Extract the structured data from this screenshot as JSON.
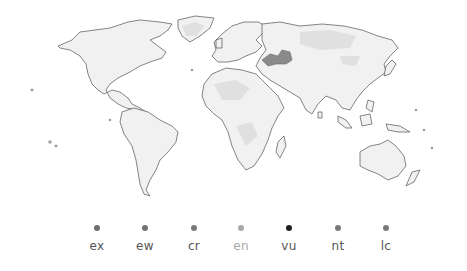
{
  "map": {
    "type": "world-distribution-map",
    "highlight_region": "central-asia"
  },
  "legend": {
    "items": [
      {
        "code": "ex",
        "x": 97,
        "dot_color": "#6e6e6e",
        "label_color": "#555555"
      },
      {
        "code": "ew",
        "x": 145,
        "dot_color": "#737373",
        "label_color": "#555555"
      },
      {
        "code": "cr",
        "x": 194,
        "dot_color": "#787878",
        "label_color": "#555555"
      },
      {
        "code": "en",
        "x": 241,
        "dot_color": "#a8a8a8",
        "label_color": "#a8a8a8"
      },
      {
        "code": "vu",
        "x": 289,
        "dot_color": "#1e1e1e",
        "label_color": "#555555"
      },
      {
        "code": "nt",
        "x": 338,
        "dot_color": "#7a7a7a",
        "label_color": "#555555"
      },
      {
        "code": "lc",
        "x": 386,
        "dot_color": "#7a7a7a",
        "label_color": "#555555"
      }
    ]
  }
}
